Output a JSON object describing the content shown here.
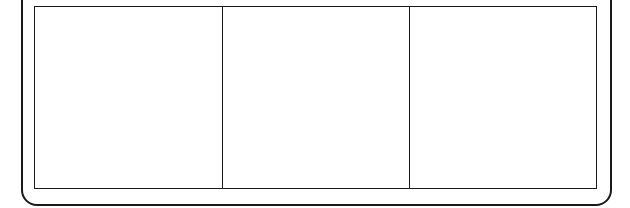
{
  "figure": {
    "type": "line-art-table-outline",
    "background_color": "#ffffff",
    "stroke_color": "#1a1a1a"
  },
  "outer_frame": {
    "name": "outer-rounded-frame",
    "shape": "rounded-rectangle",
    "stroke_color": "#1a1a1a",
    "stroke_width_px": 2,
    "corner_radius_px": 16,
    "top_edge_cropped": true,
    "label": ""
  },
  "table": {
    "name": "three-column-table",
    "stroke_color": "#1a1a1a",
    "stroke_width_px": 1.5,
    "fill_color": "#ffffff",
    "column_count": 3,
    "row_count": 1,
    "cells": [
      {
        "id": "cell-1",
        "width_px": 189,
        "text": ""
      },
      {
        "id": "cell-2",
        "width_px": 187,
        "text": ""
      },
      {
        "id": "cell-3",
        "width_px": 187,
        "text": ""
      }
    ]
  }
}
